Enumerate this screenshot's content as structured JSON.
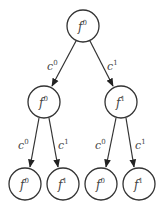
{
  "diagram": {
    "type": "binary-tree",
    "colors": {
      "stroke": "#333333",
      "text": "#444444",
      "background": "#ffffff"
    },
    "nodes": [
      {
        "id": "root",
        "base": "f",
        "sup": "0",
        "cx": 83,
        "cy": 26
      },
      {
        "id": "l",
        "base": "f",
        "sup": "0",
        "cx": 44,
        "cy": 102
      },
      {
        "id": "r",
        "base": "f",
        "sup": "1",
        "cx": 121,
        "cy": 102
      },
      {
        "id": "ll",
        "base": "f",
        "sup": "0",
        "cx": 25,
        "cy": 184
      },
      {
        "id": "lr",
        "base": "f",
        "sup": "1",
        "cx": 63,
        "cy": 184
      },
      {
        "id": "rl",
        "base": "f",
        "sup": "0",
        "cx": 101,
        "cy": 184
      },
      {
        "id": "rr",
        "base": "f",
        "sup": "1",
        "cx": 139,
        "cy": 184
      }
    ],
    "edges": [
      {
        "from": "root",
        "to": "l",
        "base": "c",
        "sup": "0"
      },
      {
        "from": "root",
        "to": "r",
        "base": "c",
        "sup": "1"
      },
      {
        "from": "l",
        "to": "ll",
        "base": "c",
        "sup": "0"
      },
      {
        "from": "l",
        "to": "lr",
        "base": "c",
        "sup": "1"
      },
      {
        "from": "r",
        "to": "rl",
        "base": "c",
        "sup": "0"
      },
      {
        "from": "r",
        "to": "rr",
        "base": "c",
        "sup": "1"
      }
    ]
  }
}
